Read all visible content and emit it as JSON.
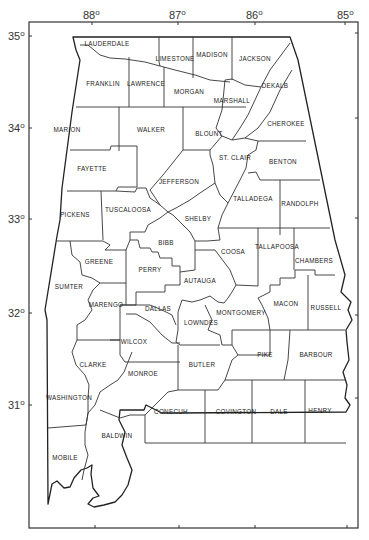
{
  "map": {
    "title": "Alabama Counties",
    "longitude_labels": [
      {
        "text": "88",
        "deg": "o",
        "x": 93,
        "tick_x": 92
      },
      {
        "text": "87",
        "deg": "o",
        "x": 178,
        "tick_x": 178
      },
      {
        "text": "86",
        "deg": "o",
        "x": 254,
        "tick_x": 255
      },
      {
        "text": "85",
        "deg": "o",
        "x": 346,
        "tick_x": 345
      }
    ],
    "latitude_labels": [
      {
        "text": "35",
        "deg": "o",
        "y": 36
      },
      {
        "text": "34",
        "deg": "o",
        "y": 128
      },
      {
        "text": "33",
        "deg": "o",
        "y": 219
      },
      {
        "text": "32",
        "deg": "o",
        "y": 313
      },
      {
        "text": "31",
        "deg": "o",
        "y": 405
      }
    ],
    "counties": [
      {
        "name": "LAUDERDALE",
        "x": 107,
        "y": 46
      },
      {
        "name": "LIMESTONE",
        "x": 175,
        "y": 59
      },
      {
        "name": "MADISON",
        "x": 212,
        "y": 56
      },
      {
        "name": "JACKSON",
        "x": 255,
        "y": 60
      },
      {
        "name": "FRANKLIN",
        "x": 103,
        "y": 84
      },
      {
        "name": "LAWRENCE",
        "x": 146,
        "y": 84
      },
      {
        "name": "MORGAN",
        "x": 189,
        "y": 92
      },
      {
        "name": "DEKALB",
        "x": 275,
        "y": 86
      },
      {
        "name": "MARSHALL",
        "x": 232,
        "y": 103
      },
      {
        "name": "CHEROKEE",
        "x": 286,
        "y": 124
      },
      {
        "name": "MARION",
        "x": 67,
        "y": 131
      },
      {
        "name": "WALKER",
        "x": 151,
        "y": 131
      },
      {
        "name": "BLOUNT",
        "x": 209,
        "y": 135
      },
      {
        "name": "ST. CLAIR",
        "x": 235,
        "y": 160
      },
      {
        "name": "BENTON",
        "x": 283,
        "y": 163
      },
      {
        "name": "FAYETTE",
        "x": 92,
        "y": 170
      },
      {
        "name": "JEFFERSON",
        "x": 179,
        "y": 183
      },
      {
        "name": "TALLADEGA",
        "x": 253,
        "y": 200
      },
      {
        "name": "RANDOLPH",
        "x": 300,
        "y": 206
      },
      {
        "name": "PICKENS",
        "x": 75,
        "y": 216
      },
      {
        "name": "TUSCALOOSA",
        "x": 128,
        "y": 211
      },
      {
        "name": "SHELBY",
        "x": 198,
        "y": 220
      },
      {
        "name": "BIBB",
        "x": 166,
        "y": 243
      },
      {
        "name": "COOSA",
        "x": 233,
        "y": 253
      },
      {
        "name": "TALLAPOOSA",
        "x": 277,
        "y": 248
      },
      {
        "name": "CHAMBERS",
        "x": 314,
        "y": 262
      },
      {
        "name": "GREENE",
        "x": 99,
        "y": 263
      },
      {
        "name": "PERRY",
        "x": 150,
        "y": 271
      },
      {
        "name": "AUTAUGA",
        "x": 200,
        "y": 282
      },
      {
        "name": "SUMTER",
        "x": 69,
        "y": 288
      },
      {
        "name": "MARENGO",
        "x": 106,
        "y": 306
      },
      {
        "name": "DALLAS",
        "x": 158,
        "y": 310
      },
      {
        "name": "MACON",
        "x": 286,
        "y": 305
      },
      {
        "name": "RUSSELL",
        "x": 326,
        "y": 309
      },
      {
        "name": "MONTGOMERY",
        "x": 241,
        "y": 314
      },
      {
        "name": "LOWNDES",
        "x": 201,
        "y": 324
      },
      {
        "name": "WILCOX",
        "x": 134,
        "y": 343
      },
      {
        "name": "PIKE",
        "x": 265,
        "y": 355
      },
      {
        "name": "BARBOUR",
        "x": 316,
        "y": 355
      },
      {
        "name": "CLARKE",
        "x": 93,
        "y": 366
      },
      {
        "name": "BUTLER",
        "x": 202,
        "y": 366
      },
      {
        "name": "MONROE",
        "x": 143,
        "y": 375
      },
      {
        "name": "WASHINGTON",
        "x": 69,
        "y": 400
      },
      {
        "name": "CONECUH",
        "x": 171,
        "y": 413
      },
      {
        "name": "COVINGTON",
        "x": 236,
        "y": 413
      },
      {
        "name": "DALE",
        "x": 279,
        "y": 413
      },
      {
        "name": "HENRY",
        "x": 320,
        "y": 412
      },
      {
        "name": "BALDWIN",
        "x": 117,
        "y": 437
      },
      {
        "name": "MOBILE",
        "x": 65,
        "y": 459
      }
    ]
  }
}
